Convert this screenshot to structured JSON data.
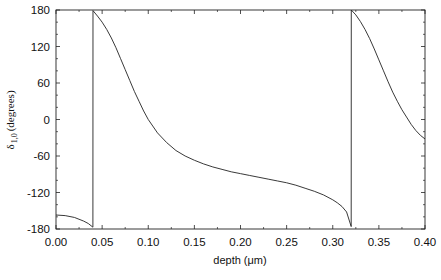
{
  "chart_data": {
    "type": "line",
    "title": "",
    "xlabel": "depth (μm)",
    "ylabel_symbol": "δ",
    "ylabel_subscript": "1,0",
    "ylabel_unit": "(degrees)",
    "xlim": [
      0.0,
      0.4
    ],
    "ylim": [
      -180,
      180
    ],
    "xticks": [
      "0.00",
      "0.05",
      "0.10",
      "0.15",
      "0.20",
      "0.25",
      "0.30",
      "0.35",
      "0.40"
    ],
    "yticks": [
      "180",
      "120",
      "60",
      "0",
      "-60",
      "-120",
      "-180"
    ],
    "grid": false,
    "legend": null,
    "series": [
      {
        "name": "delta_1_0",
        "x": [
          0.0,
          0.01,
          0.02,
          0.03,
          0.035,
          0.04,
          0.0401,
          0.045,
          0.05,
          0.055,
          0.06,
          0.065,
          0.07,
          0.075,
          0.08,
          0.085,
          0.09,
          0.095,
          0.1,
          0.11,
          0.12,
          0.13,
          0.14,
          0.15,
          0.16,
          0.17,
          0.18,
          0.19,
          0.2,
          0.21,
          0.22,
          0.23,
          0.24,
          0.25,
          0.26,
          0.27,
          0.28,
          0.29,
          0.3,
          0.305,
          0.31,
          0.315,
          0.32,
          0.3201,
          0.325,
          0.33,
          0.335,
          0.34,
          0.345,
          0.35,
          0.355,
          0.36,
          0.365,
          0.37,
          0.375,
          0.38,
          0.385,
          0.39,
          0.395,
          0.4
        ],
        "y": [
          -157,
          -158,
          -161,
          -167,
          -171,
          -177,
          179,
          170,
          160,
          148,
          134,
          118,
          100,
          82,
          64,
          46,
          30,
          14,
          0,
          -22,
          -38,
          -51,
          -60,
          -67,
          -73,
          -78,
          -82,
          -86,
          -89,
          -92,
          -95,
          -98,
          -101,
          -104,
          -108,
          -113,
          -118,
          -124,
          -132,
          -137,
          -143,
          -152,
          -176,
          180,
          172,
          161,
          148,
          133,
          116,
          98,
          80,
          62,
          45,
          30,
          16,
          4,
          -8,
          -18,
          -26,
          -32
        ]
      }
    ]
  }
}
